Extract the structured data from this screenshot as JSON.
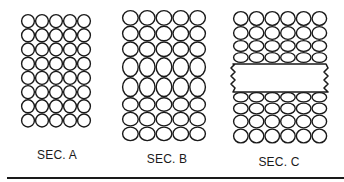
{
  "diagram": {
    "stroke_color": "#1a1a1a",
    "background": "#ffffff",
    "sections": [
      {
        "id": "A",
        "label": "SEC. A",
        "label_pos": {
          "x": 57,
          "y": 148
        },
        "x": 21,
        "columns": 5,
        "col_width": 14,
        "rows": [
          {
            "y": 14,
            "h": 14.2
          },
          {
            "y": 28.2,
            "h": 14.2
          },
          {
            "y": 42.4,
            "h": 14.2
          },
          {
            "y": 56.6,
            "h": 14.2
          },
          {
            "y": 70.8,
            "h": 14.2
          },
          {
            "y": 85.0,
            "h": 14.2
          },
          {
            "y": 99.2,
            "h": 14.2
          },
          {
            "y": 113.4,
            "h": 14.2
          }
        ],
        "note": "uniform circular cells"
      },
      {
        "id": "B",
        "label": "SEC. B",
        "label_pos": {
          "x": 167,
          "y": 152
        },
        "x": 122,
        "columns": 5,
        "col_width": 16.8,
        "rows": [
          {
            "y": 10,
            "h": 15.7
          },
          {
            "y": 25.7,
            "h": 15.7
          },
          {
            "y": 41.4,
            "h": 15.7
          },
          {
            "y": 57.1,
            "h": 20
          },
          {
            "y": 77.1,
            "h": 20
          },
          {
            "y": 97.1,
            "h": 14.7
          },
          {
            "y": 111.8,
            "h": 14.7
          },
          {
            "y": 126.5,
            "h": 14.7
          }
        ],
        "note": "middle rows vertically elongated"
      },
      {
        "id": "C",
        "label": "SEC. C",
        "label_pos": {
          "x": 279,
          "y": 155
        },
        "x": 233,
        "columns": 6,
        "col_width": 15.7,
        "rows": [
          {
            "y": 11,
            "h": 15
          },
          {
            "y": 26,
            "h": 14
          },
          {
            "y": 40,
            "h": 12
          },
          {
            "y": 52,
            "h": 11
          },
          {
            "y": 92,
            "h": 10.5
          },
          {
            "y": 102.5,
            "h": 12
          },
          {
            "y": 114.5,
            "h": 14
          },
          {
            "y": 128.5,
            "h": 15
          }
        ],
        "insert_block": {
          "x": 233,
          "y": 64,
          "w": 93,
          "h": 28,
          "edges": "wavy"
        },
        "note": "rows near block flattened; rectangular block inserted"
      }
    ],
    "baseline_rule": {
      "x": 7,
      "y": 177,
      "w": 337
    }
  }
}
